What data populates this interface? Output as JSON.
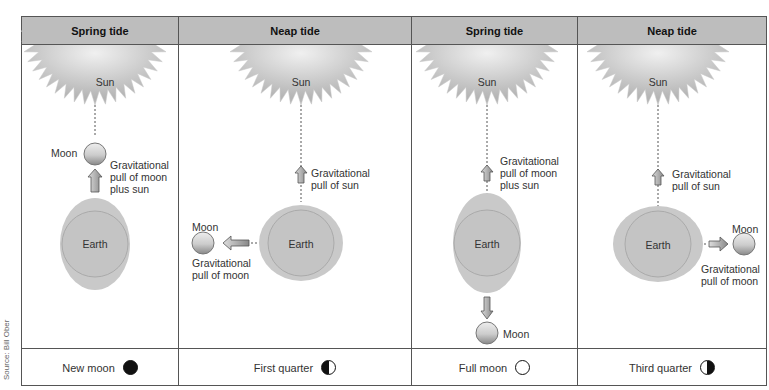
{
  "credit": "Source: Bill Ober",
  "panels": [
    {
      "title": "Spring tide",
      "sun_label": "Sun",
      "earth_label": "Earth",
      "moon_label": "Moon",
      "pull_label_1": "Gravitational",
      "pull_label_2": "pull of moon",
      "pull_label_3": "plus sun",
      "phase_label": "New moon",
      "phase_icon": "new-moon-icon"
    },
    {
      "title": "Neap tide",
      "sun_label": "Sun",
      "earth_label": "Earth",
      "moon_label": "Moon",
      "sun_pull_1": "Gravitational",
      "sun_pull_2": "pull of sun",
      "moon_pull_1": "Gravitational",
      "moon_pull_2": "pull of moon",
      "phase_label": "First quarter",
      "phase_icon": "first-quarter-icon"
    },
    {
      "title": "Spring tide",
      "sun_label": "Sun",
      "earth_label": "Earth",
      "moon_label": "Moon",
      "pull_label_1": "Gravitational",
      "pull_label_2": "pull of moon",
      "pull_label_3": "plus sun",
      "phase_label": "Full moon",
      "phase_icon": "full-moon-icon"
    },
    {
      "title": "Neap tide",
      "sun_label": "Sun",
      "earth_label": "Earth",
      "moon_label": "Moon",
      "sun_pull_1": "Gravitational",
      "sun_pull_2": "pull of sun",
      "moon_pull_1": "Gravitational",
      "moon_pull_2": "pull of moon",
      "phase_label": "Third quarter",
      "phase_icon": "third-quarter-icon"
    }
  ]
}
